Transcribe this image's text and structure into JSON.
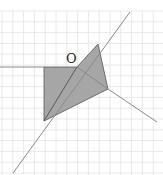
{
  "diagram": {
    "type": "geometry-figure",
    "point_label": "O",
    "colors": {
      "grid": "#e4e4e4",
      "line": "#8a8a8a",
      "shade": "#a6a6a6",
      "edge": "#555555"
    },
    "grid": {
      "x0": 2,
      "y0": 11,
      "step": 10.8,
      "cols": 15,
      "rows": 15
    },
    "points": {
      "O": [
        77,
        67
      ],
      "A": [
        44,
        67
      ],
      "B": [
        44,
        121
      ],
      "C": [
        98,
        44
      ],
      "D": [
        108,
        89
      ]
    },
    "shaded_polygons": [
      [
        [
          44,
          67
        ],
        [
          77,
          67
        ],
        [
          44,
          121
        ]
      ],
      [
        [
          77,
          67
        ],
        [
          98,
          44
        ],
        [
          108,
          89
        ],
        [
          44,
          121
        ]
      ]
    ],
    "lines": [
      {
        "from": [
          0,
          67
        ],
        "to": [
          44,
          67
        ]
      },
      {
        "from": [
          13,
          173
        ],
        "to": [
          130,
          12
        ]
      },
      {
        "from": [
          108,
          89
        ],
        "to": [
          157,
          122
        ]
      },
      {
        "from": [
          77,
          67
        ],
        "to": [
          108,
          89
        ]
      }
    ]
  }
}
